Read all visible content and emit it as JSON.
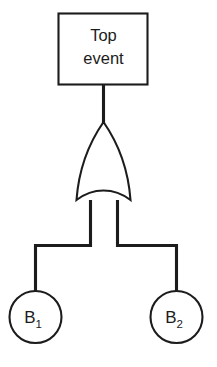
{
  "diagram": {
    "kind": "fault-tree",
    "background_color": "#ffffff",
    "line_color": "#1c1c1c",
    "top_event": {
      "shape": "rectangle",
      "label_line1": "Top",
      "label_line2": "event"
    },
    "gate": {
      "type": "OR",
      "shape": "or-gate"
    },
    "basic_events": [
      {
        "shape": "circle",
        "label_base": "B",
        "label_sub": "1"
      },
      {
        "shape": "circle",
        "label_base": "B",
        "label_sub": "2"
      }
    ]
  }
}
